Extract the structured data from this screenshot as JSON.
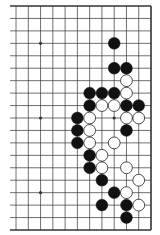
{
  "diagram": {
    "type": "go-board-fragment",
    "board_size": 19,
    "visible_edges": [
      "top",
      "right",
      "bottom"
    ],
    "visible_columns_from_right": 12,
    "colors": {
      "background": "#ffffff",
      "line": "#333333",
      "black_stone": "#111111",
      "white_stone": "#ffffff",
      "white_stone_outline": "#222222"
    },
    "star_points": [
      {
        "row": 3,
        "col": 9
      },
      {
        "row": 9,
        "col": 9
      },
      {
        "row": 15,
        "col": 9
      },
      {
        "row": 9,
        "col": 3
      }
    ],
    "stones": [
      {
        "row": 3,
        "col": 3,
        "color": "black"
      },
      {
        "row": 5,
        "col": 3,
        "color": "black"
      },
      {
        "row": 5,
        "col": 2,
        "color": "black"
      },
      {
        "row": 6,
        "col": 2,
        "color": "white"
      },
      {
        "row": 7,
        "col": 5,
        "color": "black"
      },
      {
        "row": 7,
        "col": 4,
        "color": "black"
      },
      {
        "row": 7,
        "col": 3,
        "color": "black"
      },
      {
        "row": 7,
        "col": 2,
        "color": "white"
      },
      {
        "row": 8,
        "col": 5,
        "color": "black"
      },
      {
        "row": 8,
        "col": 4,
        "color": "white"
      },
      {
        "row": 8,
        "col": 3,
        "color": "white"
      },
      {
        "row": 8,
        "col": 2,
        "color": "black"
      },
      {
        "row": 8,
        "col": 1,
        "color": "black"
      },
      {
        "row": 9,
        "col": 6,
        "color": "black"
      },
      {
        "row": 9,
        "col": 5,
        "color": "white"
      },
      {
        "row": 9,
        "col": 2,
        "color": "white"
      },
      {
        "row": 9,
        "col": 1,
        "color": "white"
      },
      {
        "row": 10,
        "col": 6,
        "color": "black"
      },
      {
        "row": 10,
        "col": 5,
        "color": "white"
      },
      {
        "row": 10,
        "col": 2,
        "color": "black"
      },
      {
        "row": 11,
        "col": 6,
        "color": "black"
      },
      {
        "row": 11,
        "col": 5,
        "color": "white"
      },
      {
        "row": 11,
        "col": 3,
        "color": "white"
      },
      {
        "row": 12,
        "col": 5,
        "color": "black"
      },
      {
        "row": 12,
        "col": 4,
        "color": "white"
      },
      {
        "row": 13,
        "col": 5,
        "color": "black"
      },
      {
        "row": 13,
        "col": 4,
        "color": "white"
      },
      {
        "row": 13,
        "col": 2,
        "color": "white"
      },
      {
        "row": 14,
        "col": 4,
        "color": "black"
      },
      {
        "row": 14,
        "col": 1,
        "color": "white"
      },
      {
        "row": 15,
        "col": 3,
        "color": "black"
      },
      {
        "row": 15,
        "col": 2,
        "color": "white"
      },
      {
        "row": 16,
        "col": 4,
        "color": "black"
      },
      {
        "row": 16,
        "col": 2,
        "color": "black"
      },
      {
        "row": 16,
        "col": 1,
        "color": "white"
      },
      {
        "row": 17,
        "col": 2,
        "color": "black"
      }
    ]
  }
}
